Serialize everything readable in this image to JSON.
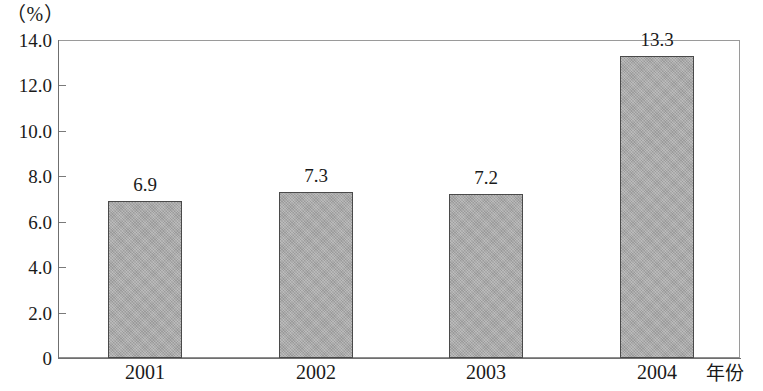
{
  "chart_data": {
    "type": "bar",
    "title": "",
    "subtitle": "",
    "categories": [
      "2001",
      "2002",
      "2003",
      "2004"
    ],
    "values": [
      6.9,
      7.3,
      7.2,
      13.3
    ],
    "data_labels": [
      "6.9",
      "7.3",
      "7.2",
      "13.3"
    ],
    "xlabel": "年份",
    "ylabel": "（%）",
    "ylim": [
      0,
      14.0
    ],
    "y_ticks": [
      0,
      2.0,
      4.0,
      6.0,
      8.0,
      10.0,
      12.0,
      14.0
    ],
    "y_tick_labels": [
      "0",
      "2.0",
      "4.0",
      "6.0",
      "8.0",
      "10.0",
      "12.0",
      "14.0"
    ],
    "grid": false,
    "legend": null,
    "bar_fill_color": "#a9a9a9",
    "bar_border_color": "#4a4a4a",
    "axis_color": "#6f6f6f",
    "background_color": "#ffffff"
  },
  "axes": {
    "unit_label": "（%）",
    "x_title": "年份"
  }
}
